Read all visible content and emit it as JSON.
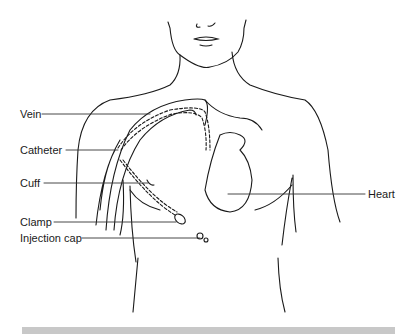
{
  "diagram": {
    "labels": [
      {
        "id": "vein",
        "text": "Vein"
      },
      {
        "id": "catheter",
        "text": "Catheter"
      },
      {
        "id": "cuff",
        "text": "Cuff"
      },
      {
        "id": "clamp",
        "text": "Clamp"
      },
      {
        "id": "injection_cap",
        "text": "Injection cap"
      },
      {
        "id": "heart",
        "text": "Heart"
      }
    ],
    "colors": {
      "line": "#1a1a1a",
      "leader": "#333333",
      "footer_bar": "#c8c8c8"
    }
  }
}
